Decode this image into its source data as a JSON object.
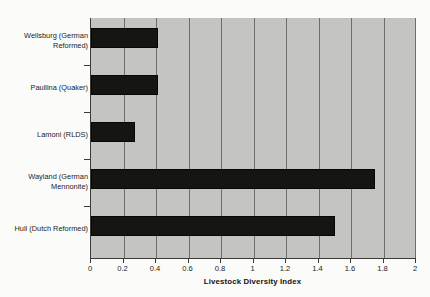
{
  "chart_data": {
    "type": "bar",
    "orientation": "horizontal",
    "title": "",
    "xlabel": "Livestock Diversity Index",
    "ylabel": "",
    "categories": [
      "Wellsburg (German Reformed)",
      "Paullina (Quaker)",
      "Lamoni (RLDS)",
      "Wayland (German Mennonite)",
      "Hull (Dutch Reformed)"
    ],
    "values": [
      0.41,
      0.41,
      0.27,
      1.75,
      1.5
    ],
    "xlim": [
      0,
      2
    ],
    "xticks": [
      0,
      0.2,
      0.4,
      0.6,
      0.8,
      1,
      1.2,
      1.4,
      1.6,
      1.8,
      2
    ],
    "xtick_labels": [
      "0",
      "0.2",
      "0.4",
      "0.6",
      "0.8",
      "1",
      "1.2",
      "1.4",
      "1.6",
      "1.8",
      "2"
    ],
    "grid": "vertical",
    "legend": "none",
    "colors": {
      "bar": "#151512",
      "plot_background": "#c4c4c0",
      "page_background": "#fbfbf9",
      "gridline": "#6e6e6c",
      "axis": "#3a3a38",
      "text": "#1c1c1a"
    }
  },
  "axis": {
    "x_title": "Livestock Diversity Index"
  },
  "category_labels": {
    "l0": "Wellsburg (German\nReformed)",
    "l1": "Paullina (Quaker)",
    "l2": "Lamoni (RLDS)",
    "l3": "Wayland (German\nMennonite)",
    "l4": "Hull (Dutch Reformed)"
  },
  "tick_labels": {
    "t0": "0",
    "t1": "0.2",
    "t2": "0.4",
    "t3": "0.6",
    "t4": "0.8",
    "t5": "1",
    "t6": "1.2",
    "t7": "1.4",
    "t8": "1.6",
    "t9": "1.8",
    "t10": "2"
  }
}
